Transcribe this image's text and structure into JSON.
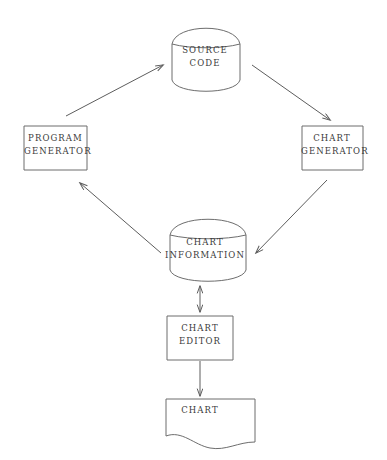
{
  "diagram": {
    "background_color": "#ffffff",
    "stroke_color": "#6d6d6d",
    "text_color": "#3a3a3a",
    "nodes": [
      {
        "id": "source-code",
        "shape": "cylinder",
        "lines": [
          "SOURCE",
          "CODE"
        ],
        "line1": "SOURCE",
        "line2": "CODE"
      },
      {
        "id": "program-generator",
        "shape": "rectangle",
        "lines": [
          "PROGRAM",
          "GENERATOR"
        ],
        "line1": "PROGRAM",
        "line2": "GENERATOR"
      },
      {
        "id": "chart-generator",
        "shape": "rectangle",
        "lines": [
          "CHART",
          "GENERATOR"
        ],
        "line1": "CHART",
        "line2": "GENERATOR"
      },
      {
        "id": "chart-information",
        "shape": "cylinder",
        "lines": [
          "CHART",
          "INFORMATION"
        ],
        "line1": "CHART",
        "line2": "INFORMATION"
      },
      {
        "id": "chart-editor",
        "shape": "rectangle",
        "lines": [
          "CHART",
          "EDITOR"
        ],
        "line1": "CHART",
        "line2": "EDITOR"
      },
      {
        "id": "chart",
        "shape": "document",
        "lines": [
          "CHART"
        ],
        "line1": "CHART",
        "line2": ""
      }
    ],
    "edges": [
      {
        "id": "program-generator-to-source-code",
        "from": "program-generator",
        "to": "source-code",
        "direction": "single",
        "style": "diagonal"
      },
      {
        "id": "source-code-to-chart-generator",
        "from": "source-code",
        "to": "chart-generator",
        "direction": "single",
        "style": "diagonal"
      },
      {
        "id": "chart-generator-to-chart-information",
        "from": "chart-generator",
        "to": "chart-information",
        "direction": "single",
        "style": "diagonal"
      },
      {
        "id": "chart-information-to-program-generator",
        "from": "chart-information",
        "to": "program-generator",
        "direction": "single",
        "style": "diagonal"
      },
      {
        "id": "chart-information-chart-editor",
        "from": "chart-information",
        "to": "chart-editor",
        "direction": "double",
        "style": "vertical"
      },
      {
        "id": "chart-editor-to-chart",
        "from": "chart-editor",
        "to": "chart",
        "direction": "single",
        "style": "vertical"
      }
    ]
  }
}
